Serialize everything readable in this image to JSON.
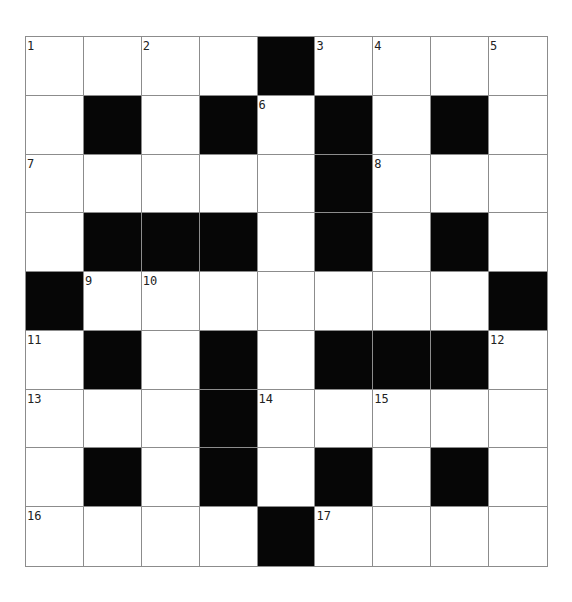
{
  "puzzle": {
    "type": "crossword",
    "rows": 9,
    "cols": 9,
    "layout": [
      "#####.####",
      "placeholder"
    ],
    "grid": [
      [
        {
          "b": 0,
          "n": "1"
        },
        {
          "b": 0
        },
        {
          "b": 0,
          "n": "2"
        },
        {
          "b": 0
        },
        {
          "b": 1
        },
        {
          "b": 0,
          "n": "3"
        },
        {
          "b": 0,
          "n": "4"
        },
        {
          "b": 0
        },
        {
          "b": 0,
          "n": "5"
        }
      ],
      [
        {
          "b": 0
        },
        {
          "b": 1
        },
        {
          "b": 0
        },
        {
          "b": 1
        },
        {
          "b": 0,
          "n": "6"
        },
        {
          "b": 1
        },
        {
          "b": 0
        },
        {
          "b": 1
        },
        {
          "b": 0
        }
      ],
      [
        {
          "b": 0,
          "n": "7"
        },
        {
          "b": 0
        },
        {
          "b": 0
        },
        {
          "b": 0
        },
        {
          "b": 0
        },
        {
          "b": 1
        },
        {
          "b": 0,
          "n": "8"
        },
        {
          "b": 0
        },
        {
          "b": 0
        }
      ],
      [
        {
          "b": 0
        },
        {
          "b": 1
        },
        {
          "b": 1
        },
        {
          "b": 1
        },
        {
          "b": 0
        },
        {
          "b": 1
        },
        {
          "b": 0
        },
        {
          "b": 1
        },
        {
          "b": 0
        }
      ],
      [
        {
          "b": 1
        },
        {
          "b": 0,
          "n": "9"
        },
        {
          "b": 0,
          "n": "10"
        },
        {
          "b": 0
        },
        {
          "b": 0
        },
        {
          "b": 0
        },
        {
          "b": 0
        },
        {
          "b": 0
        },
        {
          "b": 1
        }
      ],
      [
        {
          "b": 0,
          "n": "11"
        },
        {
          "b": 1
        },
        {
          "b": 0
        },
        {
          "b": 1
        },
        {
          "b": 0
        },
        {
          "b": 1
        },
        {
          "b": 1
        },
        {
          "b": 1
        },
        {
          "b": 0,
          "n": "12"
        }
      ],
      [
        {
          "b": 0,
          "n": "13"
        },
        {
          "b": 0
        },
        {
          "b": 0
        },
        {
          "b": 1
        },
        {
          "b": 0,
          "n": "14"
        },
        {
          "b": 0
        },
        {
          "b": 0,
          "n": "15"
        },
        {
          "b": 0
        },
        {
          "b": 0
        }
      ],
      [
        {
          "b": 0
        },
        {
          "b": 1
        },
        {
          "b": 0
        },
        {
          "b": 1
        },
        {
          "b": 0
        },
        {
          "b": 1
        },
        {
          "b": 0
        },
        {
          "b": 1
        },
        {
          "b": 0
        }
      ],
      [
        {
          "b": 0,
          "n": "16"
        },
        {
          "b": 0
        },
        {
          "b": 0
        },
        {
          "b": 0
        },
        {
          "b": 1
        },
        {
          "b": 0,
          "n": "17"
        },
        {
          "b": 0
        },
        {
          "b": 0
        },
        {
          "b": 0
        }
      ]
    ],
    "clue_numbers": [
      "1",
      "2",
      "3",
      "4",
      "5",
      "6",
      "7",
      "8",
      "9",
      "10",
      "11",
      "12",
      "13",
      "14",
      "15",
      "16",
      "17"
    ],
    "colors": {
      "black_cell": "#060606",
      "white_cell": "#ffffff",
      "grid_line": "#8c8c8c",
      "number_text": "#222222"
    }
  }
}
